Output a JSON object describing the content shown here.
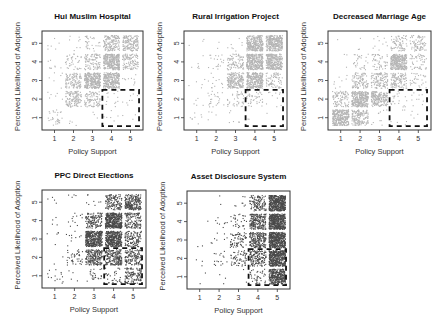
{
  "figure": {
    "xlabel": "Policy Support",
    "ylabel": "Perceived Likelihood of Adoption",
    "highlight_region": {
      "x_range": [
        3.5,
        5.5
      ],
      "y_range": [
        0.5,
        2.5
      ],
      "style": "dashed"
    }
  },
  "chart_data": [
    {
      "type": "scatter",
      "title": "Hui Muslim Hospital",
      "xlabel": "Policy Support",
      "ylabel": "Perceived Likelihood of Adoption",
      "xlim": [
        0.5,
        5.5
      ],
      "ylim": [
        0.5,
        5.5
      ],
      "xticks": [
        "1",
        "2",
        "3",
        "4",
        "5"
      ],
      "yticks": [
        "1",
        "2",
        "3",
        "4",
        "5"
      ],
      "point_color": "#b4b4b4",
      "jitter": "uniform within each integer cell",
      "cell_counts_note": "rows = likelihood 1..5, columns = support 1..5; approximate number of respondents per cell",
      "cell_counts": [
        [
          30,
          4,
          3,
          6,
          3
        ],
        [
          6,
          130,
          90,
          12,
          8
        ],
        [
          6,
          110,
          300,
          280,
          10
        ],
        [
          8,
          40,
          95,
          300,
          110
        ],
        [
          6,
          8,
          30,
          150,
          150
        ]
      ]
    },
    {
      "type": "scatter",
      "title": "Rural Irrigation Project",
      "xlabel": "Policy Support",
      "ylabel": "Perceived Likelihood of Adoption",
      "xlim": [
        0.5,
        5.5
      ],
      "ylim": [
        0.5,
        5.5
      ],
      "xticks": [
        "1",
        "2",
        "3",
        "4",
        "5"
      ],
      "yticks": [
        "1",
        "2",
        "3",
        "4",
        "5"
      ],
      "point_color": "#b4b4b4",
      "cell_counts": [
        [
          8,
          4,
          6,
          2,
          1
        ],
        [
          5,
          25,
          40,
          40,
          10
        ],
        [
          5,
          12,
          200,
          280,
          70
        ],
        [
          6,
          20,
          90,
          320,
          280
        ],
        [
          3,
          2,
          8,
          280,
          300
        ]
      ]
    },
    {
      "type": "scatter",
      "title": "Decreased Marriage Age",
      "xlabel": "Policy Support",
      "ylabel": "Perceived Likelihood of Adoption",
      "xlim": [
        0.5,
        5.5
      ],
      "ylim": [
        0.5,
        5.5
      ],
      "xticks": [
        "1",
        "2",
        "3",
        "4",
        "5"
      ],
      "yticks": [
        "1",
        "2",
        "3",
        "4",
        "5"
      ],
      "point_color": "#b4b4b4",
      "cell_counts": [
        [
          300,
          160,
          10,
          6,
          4
        ],
        [
          90,
          300,
          200,
          20,
          10
        ],
        [
          8,
          100,
          120,
          110,
          30
        ],
        [
          3,
          30,
          50,
          300,
          50
        ],
        [
          1,
          3,
          10,
          70,
          80
        ]
      ]
    },
    {
      "type": "scatter",
      "title": "PPC Direct Elections",
      "xlabel": "Policy Support",
      "ylabel": "Perceived Likelihood of Adoption",
      "xlim": [
        0.5,
        5.5
      ],
      "ylim": [
        0.5,
        5.5
      ],
      "xticks": [
        "1",
        "2",
        "3",
        "4",
        "5"
      ],
      "yticks": [
        "1",
        "2",
        "3",
        "4",
        "5"
      ],
      "point_color": "#4a4a4a",
      "cell_counts": [
        [
          14,
          4,
          25,
          30,
          120
        ],
        [
          2,
          40,
          200,
          200,
          130
        ],
        [
          5,
          10,
          380,
          380,
          120
        ],
        [
          4,
          12,
          130,
          420,
          130
        ],
        [
          4,
          4,
          8,
          130,
          220
        ]
      ]
    },
    {
      "type": "scatter",
      "title": "Asset Disclosure System",
      "xlabel": "Policy Support",
      "ylabel": "Perceived Likelihood of Adoption",
      "xlim": [
        0.5,
        5.5
      ],
      "ylim": [
        0.5,
        5.5
      ],
      "xticks": [
        "1",
        "2",
        "3",
        "4",
        "5"
      ],
      "yticks": [
        "1",
        "2",
        "3",
        "4",
        "5"
      ],
      "point_color": "#4a4a4a",
      "cell_counts": [
        [
          2,
          3,
          2,
          40,
          320
        ],
        [
          3,
          16,
          60,
          150,
          420
        ],
        [
          2,
          8,
          70,
          200,
          450
        ],
        [
          1,
          8,
          30,
          200,
          450
        ],
        [
          0,
          2,
          8,
          120,
          450
        ]
      ]
    }
  ]
}
